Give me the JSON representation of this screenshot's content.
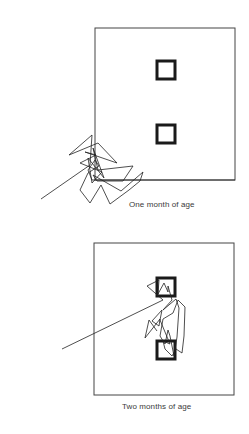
{
  "panels": [
    {
      "id": "one-month",
      "caption": "One month of age",
      "frame": {
        "x": 95,
        "y": 28,
        "w": 140,
        "h": 152
      },
      "targets": [
        {
          "x": 157,
          "y": 61,
          "w": 18,
          "h": 18
        },
        {
          "x": 157,
          "y": 125,
          "w": 18,
          "h": 18
        }
      ],
      "scanpath": "41,199 90,165 92,135 69,155 98,143 117,163 85,152 96,155 80,163 102,172 92,183 88,158 104,178 93,148 98,170 133,166 123,181 97,181 93,175 121,191 143,172 140,181 129,190 110,204 101,185 90,203 80,190 88,173 99,166 95,160 88,170 92,180 114,180 235,180",
      "stroke_color": "#222222"
    },
    {
      "id": "two-months",
      "caption": "Two months of age",
      "frame": {
        "x": 94,
        "y": 243,
        "w": 140,
        "h": 152
      },
      "targets": [
        {
          "x": 157,
          "y": 278,
          "w": 18,
          "h": 18
        },
        {
          "x": 157,
          "y": 341,
          "w": 18,
          "h": 18
        }
      ],
      "scanpath": "62,349 163,300 147,286 159,280 158,294 164,283 168,292 168,286 172,300 163,310 176,299 179,308 177,337 174,356 170,336 168,330 165,344 160,336 163,319 173,313 178,300 185,307 184,336 182,353 176,349 172,356 165,349 163,341 170,344 160,320 162,310 152,321 159,326 160,319 145,338 149,320 157,331",
      "stroke_color": "#222222"
    }
  ]
}
